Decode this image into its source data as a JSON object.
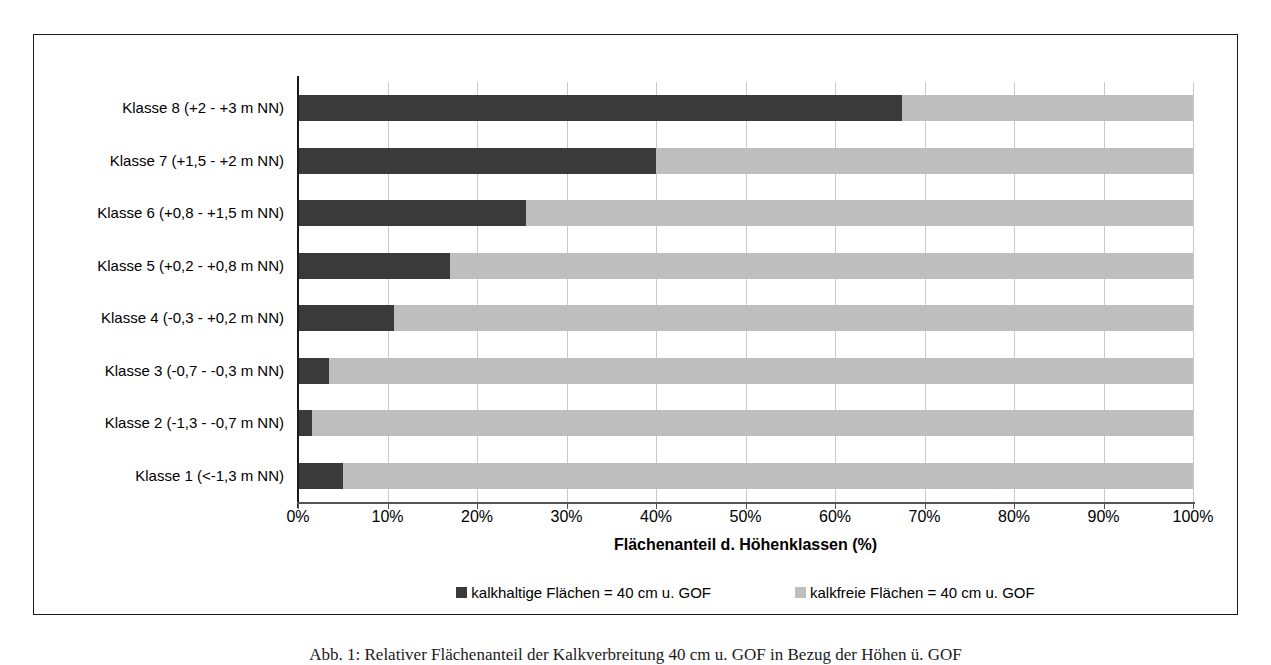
{
  "chart_data": {
    "type": "bar",
    "orientation": "horizontal",
    "stacked": true,
    "title": "",
    "xlabel": "Flächenanteil d. Höhenklassen (%)",
    "ylabel": "",
    "xlim": [
      0,
      100
    ],
    "grid": true,
    "legend_position": "bottom",
    "categories": [
      "Klasse 1 (<-1,3 m NN)",
      "Klasse 2 (-1,3 - -0,7 m NN)",
      "Klasse 3 (-0,7 - -0,3 m NN)",
      "Klasse 4 (-0,3 - +0,2 m NN)",
      "Klasse 5 (+0,2 - +0,8 m NN)",
      "Klasse 6 (+0,8 - +1,5 m NN)",
      "Klasse 7 (+1,5 - +2 m NN)",
      "Klasse 8 (+2 - +3 m NN)"
    ],
    "series": [
      {
        "name": "kalkhaltige Flächen = 40 cm u. GOF",
        "color": "#3a3a3a",
        "values": [
          5.0,
          1.6,
          3.5,
          10.7,
          17.0,
          25.5,
          40.0,
          67.5
        ]
      },
      {
        "name": "kalkfreie Flächen = 40 cm u. GOF",
        "color": "#bebebe",
        "values": [
          95.0,
          98.4,
          96.5,
          89.3,
          83.0,
          74.5,
          60.0,
          32.5
        ]
      }
    ],
    "xticks": [
      {
        "value": 0,
        "label": "0%"
      },
      {
        "value": 10,
        "label": "10%"
      },
      {
        "value": 20,
        "label": "20%"
      },
      {
        "value": 30,
        "label": "30%"
      },
      {
        "value": 40,
        "label": "40%"
      },
      {
        "value": 50,
        "label": "50%"
      },
      {
        "value": 60,
        "label": "60%"
      },
      {
        "value": 70,
        "label": "70%"
      },
      {
        "value": 80,
        "label": "80%"
      },
      {
        "value": 90,
        "label": "90%"
      },
      {
        "value": 100,
        "label": "100%"
      }
    ]
  },
  "caption": "Abb. 1: Relativer Flächenanteil der Kalkverbreitung 40 cm u. GOF in Bezug der Höhen ü. GOF"
}
